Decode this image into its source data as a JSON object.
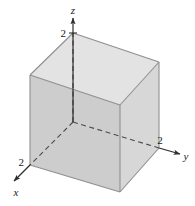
{
  "figure": {
    "caption": "",
    "background_color": "#ffffff",
    "axes": [
      {
        "name": "x",
        "label": "x",
        "tick_label": "2",
        "direction": "down-left-front",
        "style": "solid-with-arrow"
      },
      {
        "name": "y",
        "label": "y",
        "tick_label": "2",
        "direction": "right",
        "style": "solid-with-arrow"
      },
      {
        "name": "z",
        "label": "z",
        "tick_label": "2",
        "direction": "up",
        "style": "solid-with-arrow"
      }
    ],
    "solid": {
      "shape": "cube",
      "side_length": 2,
      "faces": [
        {
          "name": "top-face",
          "fill": "#e2e2e2"
        },
        {
          "name": "left-face",
          "fill": "#cfcfcf"
        },
        {
          "name": "right-face",
          "fill": "#d9d9d9"
        }
      ],
      "edge_color": "#8a8a8a",
      "hidden_edge_style": "dashed"
    },
    "hidden_lines": [
      {
        "name": "origin-to-z",
        "from": "origin",
        "to": "z-tick-2"
      },
      {
        "name": "origin-to-x",
        "from": "origin",
        "to": "x-tick-2"
      },
      {
        "name": "origin-to-y",
        "from": "origin",
        "to": "y-tick-2"
      },
      {
        "name": "back-vertical-edge",
        "from": "origin",
        "to": "top-back-corner"
      }
    ],
    "colors": {
      "line": "#3a3a3a",
      "text": "#1a1a1a",
      "top_face": "#e2e2e2",
      "left_face": "#cfcfcf",
      "right_face": "#d9d9d9",
      "edge": "#8a8a8a"
    }
  }
}
